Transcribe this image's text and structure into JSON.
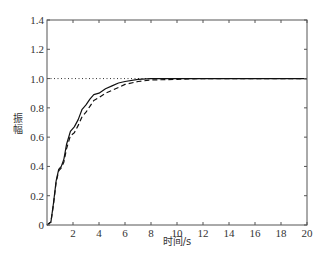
{
  "chart_data": {
    "type": "line",
    "title": "",
    "xlabel": "时间/s",
    "ylabel": "振幅",
    "xlim": [
      0,
      20
    ],
    "ylim": [
      0,
      1.4
    ],
    "xticks": [
      2,
      4,
      6,
      8,
      10,
      12,
      14,
      16,
      18,
      20
    ],
    "yticks": [
      0,
      0.2,
      0.4,
      0.6,
      0.8,
      1.0,
      1.2,
      1.4
    ],
    "ytick_labels": [
      "0",
      "0.2",
      "0.4",
      "0.6",
      "0.8",
      "1.0",
      "1.2",
      "1.4"
    ],
    "grid": false,
    "legend": null,
    "reference_line": {
      "y": 1.0,
      "style": "dotted"
    },
    "series": [
      {
        "name": "solid",
        "style": "solid",
        "x": [
          0,
          0.3,
          0.5,
          0.7,
          0.9,
          1.1,
          1.3,
          1.5,
          1.8,
          2.1,
          2.4,
          2.7,
          3.0,
          3.3,
          3.6,
          4.0,
          4.5,
          5.0,
          5.5,
          6.0,
          7.0,
          8.0,
          10,
          12,
          14,
          16,
          18,
          20
        ],
        "y": [
          0,
          0.02,
          0.15,
          0.3,
          0.38,
          0.4,
          0.45,
          0.55,
          0.64,
          0.67,
          0.72,
          0.79,
          0.82,
          0.86,
          0.89,
          0.9,
          0.93,
          0.95,
          0.97,
          0.98,
          0.995,
          1.0,
          1.0,
          1.0,
          1.0,
          1.0,
          1.0,
          1.0
        ]
      },
      {
        "name": "dashed",
        "style": "dashed",
        "x": [
          0,
          0.3,
          0.5,
          0.7,
          0.9,
          1.1,
          1.3,
          1.5,
          1.8,
          2.1,
          2.4,
          2.7,
          3.0,
          3.3,
          3.6,
          4.0,
          4.5,
          5.0,
          5.5,
          6.0,
          7.0,
          8.0,
          10,
          12,
          14,
          16,
          18,
          20
        ],
        "y": [
          0,
          0.02,
          0.14,
          0.29,
          0.37,
          0.39,
          0.43,
          0.52,
          0.61,
          0.63,
          0.68,
          0.74,
          0.77,
          0.81,
          0.85,
          0.87,
          0.9,
          0.92,
          0.94,
          0.96,
          0.98,
          0.99,
          0.995,
          1.0,
          1.0,
          1.0,
          1.0,
          1.0
        ]
      }
    ]
  }
}
